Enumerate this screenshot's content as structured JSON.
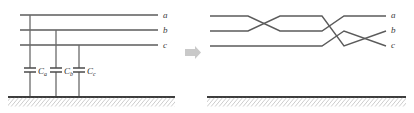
{
  "figure": {
    "canvas": {
      "width": 414,
      "height": 113,
      "background": "#ffffff"
    },
    "colors": {
      "conductor": "#5b5b5b",
      "ground": "#3d3d3d",
      "hatch": "#8a8a8a",
      "arrow": "#c9c9c9",
      "label": "#3a3a3a"
    }
  },
  "left_panel": {
    "name": "untransposed-line-with-shunt-capacitances",
    "conductors": [
      {
        "id": "a",
        "label": "a",
        "y": 15,
        "x_start": 20,
        "x_end": 158,
        "label_x": 163,
        "label_y": 18
      },
      {
        "id": "b",
        "label": "b",
        "y": 30,
        "x_start": 20,
        "x_end": 158,
        "label_x": 163,
        "label_y": 33
      },
      {
        "id": "c",
        "label": "c",
        "y": 45,
        "x_start": 20,
        "x_end": 158,
        "label_x": 163,
        "label_y": 48
      }
    ],
    "ground": {
      "y": 97,
      "x_start": 8,
      "x_end": 175,
      "hatch_depth": 9
    },
    "capacitors": [
      {
        "id": "Ca",
        "symbol": "C",
        "subscript": "a",
        "drop_x": 30,
        "from_y": 15,
        "to_y": 97,
        "plate_y_top": 68,
        "plate_y_bottom": 72,
        "plate_half_width": 6,
        "label_x": 37,
        "label_y": 74
      },
      {
        "id": "Cb",
        "symbol": "C",
        "subscript": "b",
        "drop_x": 56,
        "from_y": 30,
        "to_y": 97,
        "plate_y_top": 68,
        "plate_y_bottom": 72,
        "plate_half_width": 6,
        "label_x": 63,
        "label_y": 74
      },
      {
        "id": "Cc",
        "symbol": "C",
        "subscript": "c",
        "drop_x": 79,
        "from_y": 45,
        "to_y": 97,
        "plate_y_top": 68,
        "plate_y_bottom": 72,
        "plate_half_width": 6,
        "label_x": 86,
        "label_y": 74
      }
    ]
  },
  "arrow": {
    "name": "transformation-arrow",
    "direction": "right",
    "x": 185,
    "y": 52,
    "width": 15,
    "height": 11
  },
  "right_panel": {
    "name": "transposed-line",
    "conductors": [
      {
        "id": "a",
        "label": "a",
        "label_x": 391,
        "label_y": 18,
        "points": "210,16 250,16 278,31 320,31 345,16 375,16 386,16"
      },
      {
        "id": "b",
        "label": "b",
        "label_x": 391,
        "label_y": 33,
        "points": "210,31 250,31 278,16 320,16 345,46 375,31 386,31"
      },
      {
        "id": "c",
        "label": "c",
        "label_x": 391,
        "label_y": 48,
        "points": "210,46 250,46 278,46 320,46 345,31 375,46 386,46"
      }
    ],
    "ground": {
      "y": 97,
      "x_start": 207,
      "x_end": 406,
      "hatch_depth": 9
    },
    "transposition_points": [
      264,
      357
    ]
  }
}
